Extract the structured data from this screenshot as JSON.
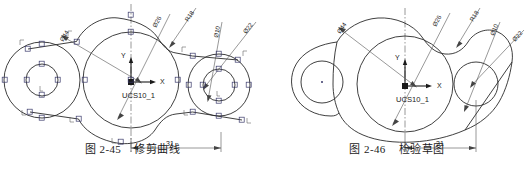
{
  "page": {
    "background": "#ffffff",
    "line_color": "#2a2a2a",
    "construction_color": "#555555",
    "grip_color": "#3a3a6a"
  },
  "figures": [
    {
      "id": "fig-2-45",
      "caption_number": "图 2-45",
      "caption_title": "修剪曲线",
      "ucs_label": "UCS10_1",
      "axis_labels": {
        "x": "X",
        "y": "Y"
      },
      "dimensions": [
        {
          "name": "dia-26",
          "text": "Ø26"
        },
        {
          "name": "dia-44",
          "text": "Ø44"
        },
        {
          "name": "radius-18",
          "text": "R18"
        },
        {
          "name": "dia-10",
          "text": "Ø10"
        },
        {
          "name": "dia-22",
          "text": "Ø22"
        },
        {
          "name": "linear-31",
          "text": "31"
        }
      ],
      "notes": "Trimmed curve construction sketch with visible AutoCAD grip markers on circles"
    },
    {
      "id": "fig-2-46",
      "caption_number": "图 2-46",
      "caption_title": "检验草图",
      "ucs_label": "UCS10_1",
      "axis_labels": {
        "x": "X",
        "y": "Y"
      },
      "dimensions": [
        {
          "name": "dia-26",
          "text": "Ø26"
        },
        {
          "name": "dia-44",
          "text": "Ø44"
        },
        {
          "name": "radius-18",
          "text": "R18"
        },
        {
          "name": "dia-10",
          "text": "Ø10"
        },
        {
          "name": "dia-22",
          "text": "Ø22"
        },
        {
          "name": "linear-31",
          "text": "31"
        }
      ],
      "notes": "Finished verification sketch of the same part outline"
    }
  ]
}
